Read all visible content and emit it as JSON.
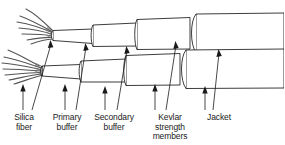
{
  "figure": {
    "kind": "technical-line-diagram",
    "background_color": "#ffffff",
    "line_color": "#1a1a1a",
    "fiber_color": "#555555",
    "label_color": "#222222"
  },
  "labels": [
    {
      "id": "silica-fiber",
      "line1": "Silica",
      "line2": "fiber",
      "line3": "",
      "x": 10,
      "y": 113
    },
    {
      "id": "primary-buffer",
      "line1": "Primary",
      "line2": "buffer",
      "line3": "",
      "x": 52,
      "y": 113
    },
    {
      "id": "secondary-buffer",
      "line1": "Secondary",
      "line2": "buffer",
      "line3": "",
      "x": 94,
      "y": 113
    },
    {
      "id": "kevlar-strength-members",
      "line1": "Kevlar",
      "line2": "strength",
      "line3": "members",
      "x": 150,
      "y": 113
    },
    {
      "id": "jacket",
      "line1": "Jacket",
      "line2": "",
      "line3": "",
      "x": 215,
      "y": 113
    }
  ],
  "layers": [
    {
      "id": "silica-fiber",
      "name": "Silica fiber",
      "order": 1
    },
    {
      "id": "primary-buffer",
      "name": "Primary buffer",
      "order": 2
    },
    {
      "id": "secondary-buffer",
      "name": "Secondary buffer",
      "order": 3
    },
    {
      "id": "kevlar-strength-members",
      "name": "Kevlar strength members",
      "order": 4
    },
    {
      "id": "jacket",
      "name": "Jacket",
      "order": 5
    }
  ],
  "cables": [
    {
      "id": "upper-cable",
      "position": "upper"
    },
    {
      "id": "lower-cable",
      "position": "lower"
    }
  ]
}
